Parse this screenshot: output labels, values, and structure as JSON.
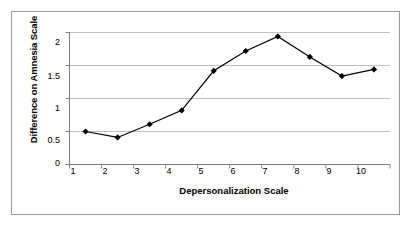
{
  "chart_data": {
    "type": "line",
    "title": "",
    "xlabel": "Depersonalization Scale",
    "ylabel": "Difference on Amnesia Scale",
    "categories": [
      "1",
      "2",
      "3",
      "4",
      "5",
      "6",
      "7",
      "8",
      "9",
      "10"
    ],
    "values": [
      0.5,
      0.41,
      0.61,
      0.82,
      1.42,
      1.72,
      1.94,
      1.63,
      1.34,
      1.44
    ],
    "ylim": [
      0,
      2
    ],
    "yticks": [
      "0",
      "0.5",
      "1",
      "1.5",
      "2"
    ],
    "ytick_values": [
      0,
      0.5,
      1,
      1.5,
      2
    ],
    "grid": "horizontal",
    "legend": "none",
    "marker": "diamond",
    "series": [
      {
        "name": "Difference on Amnesia Scale",
        "values": [
          0.5,
          0.41,
          0.61,
          0.82,
          1.42,
          1.72,
          1.94,
          1.63,
          1.34,
          1.44
        ]
      }
    ],
    "colors": {
      "line": "#000000",
      "marker": "#000000",
      "grid": "#bfbfbf",
      "axis": "#808080",
      "border": "#9a9a9a",
      "background": "#ffffff"
    }
  }
}
